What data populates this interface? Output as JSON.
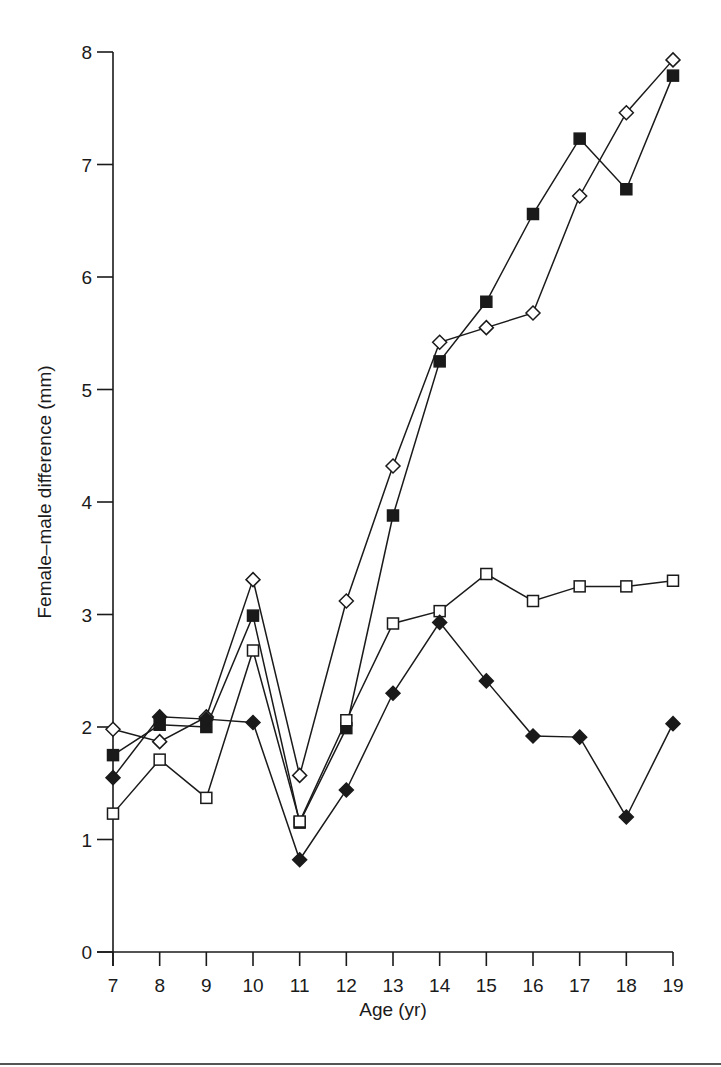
{
  "chart_data": {
    "type": "line",
    "title": "",
    "xlabel": "Age (yr)",
    "ylabel": "Female–male difference (mm)",
    "x": [
      7,
      8,
      9,
      10,
      11,
      12,
      13,
      14,
      15,
      16,
      17,
      18,
      19
    ],
    "xticks": [
      "7",
      "8",
      "9",
      "10",
      "11",
      "12",
      "13",
      "14",
      "15",
      "16",
      "17",
      "18",
      "19"
    ],
    "yticks": [
      "0",
      "1",
      "2",
      "3",
      "4",
      "5",
      "6",
      "7",
      "8"
    ],
    "xlim": [
      7,
      19
    ],
    "ylim": [
      0,
      8
    ],
    "grid": false,
    "legend": null,
    "series": [
      {
        "name": "open-diamond",
        "marker": "diamond-open",
        "values": [
          1.98,
          1.87,
          2.09,
          3.31,
          1.57,
          3.12,
          4.32,
          5.42,
          5.55,
          5.68,
          6.72,
          7.46,
          7.93
        ]
      },
      {
        "name": "filled-square",
        "marker": "square-filled",
        "values": [
          1.75,
          2.02,
          2.0,
          2.99,
          1.15,
          1.99,
          3.88,
          5.25,
          5.78,
          6.56,
          7.23,
          6.78,
          7.79
        ]
      },
      {
        "name": "open-square",
        "marker": "square-open",
        "values": [
          1.23,
          1.71,
          1.37,
          2.68,
          1.16,
          2.06,
          2.92,
          3.03,
          3.36,
          3.12,
          3.25,
          3.25,
          3.3
        ]
      },
      {
        "name": "filled-diamond",
        "marker": "diamond-filled",
        "values": [
          1.55,
          2.09,
          2.07,
          2.04,
          0.82,
          1.44,
          2.3,
          2.93,
          2.41,
          1.92,
          1.91,
          1.2,
          2.03
        ]
      }
    ]
  },
  "colors": {
    "ink": "#1a1a1a",
    "background": "#ffffff"
  }
}
